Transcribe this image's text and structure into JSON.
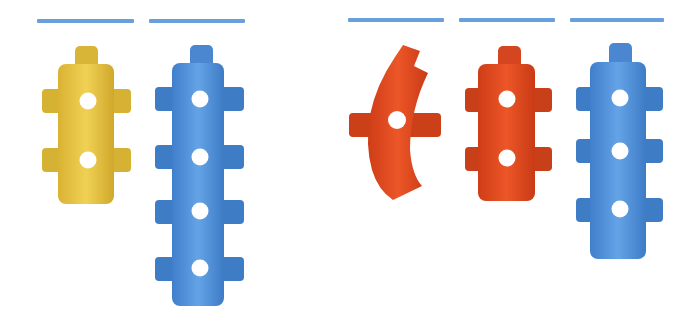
{
  "colors": {
    "background": "#ffffff",
    "answer_line": "#6a9fdd",
    "yellow": "#e7c43f",
    "yellow_dark": "#cfa92a",
    "blue": "#4f8fd8",
    "blue_dark": "#3a76c0",
    "red": "#e2481e",
    "red_dark": "#c43a16"
  },
  "answer_lines": [
    {
      "x": 37,
      "y": 19,
      "w": 97
    },
    {
      "x": 149,
      "y": 19,
      "w": 96
    },
    {
      "x": 348,
      "y": 18,
      "w": 96
    },
    {
      "x": 459,
      "y": 18,
      "w": 96
    },
    {
      "x": 570,
      "y": 18,
      "w": 94
    }
  ],
  "pieces": [
    {
      "id": "yellow-straight-2",
      "color": "yellow",
      "holes": 2
    },
    {
      "id": "blue-straight-4",
      "color": "blue",
      "holes": 4
    },
    {
      "id": "red-curved-1",
      "color": "red",
      "holes": 1
    },
    {
      "id": "red-straight-2",
      "color": "red",
      "holes": 2
    },
    {
      "id": "blue-straight-3",
      "color": "blue",
      "holes": 3
    }
  ]
}
